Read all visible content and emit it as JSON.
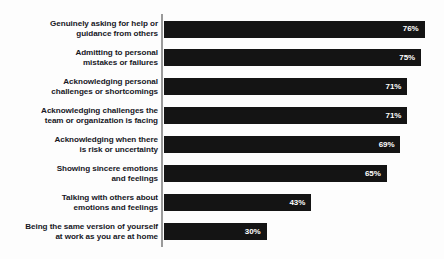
{
  "chart_data": {
    "type": "bar",
    "orientation": "horizontal",
    "title": "",
    "subtitle": "",
    "xlabel": "",
    "ylabel": "",
    "xlim": [
      0,
      76
    ],
    "grid": false,
    "legend": null,
    "value_suffix": "%",
    "categories": [
      "Genuinely asking for help or\nguidance from others",
      "Admitting to personal\nmistakes or failures",
      "Acknowledging personal\nchallenges or shortcomings",
      "Acknowledging challenges the\nteam or organization is facing",
      "Acknowledging when there\nis risk or uncertainty",
      "Showing sincere emotions\nand feelings",
      "Talking with others about\nemotions and feelings",
      "Being the same version of yourself\nat work as you are at home"
    ],
    "values": [
      76,
      75,
      71,
      71,
      69,
      65,
      43,
      30
    ],
    "value_labels": [
      "76%",
      "75%",
      "71%",
      "71%",
      "69%",
      "65%",
      "43%",
      "30%"
    ],
    "colors": {
      "bar": "#141414",
      "value_text": "#ffffff",
      "category_text": "#17171f",
      "axis": "#9a9a9a",
      "background": "#fdfdfd"
    }
  }
}
